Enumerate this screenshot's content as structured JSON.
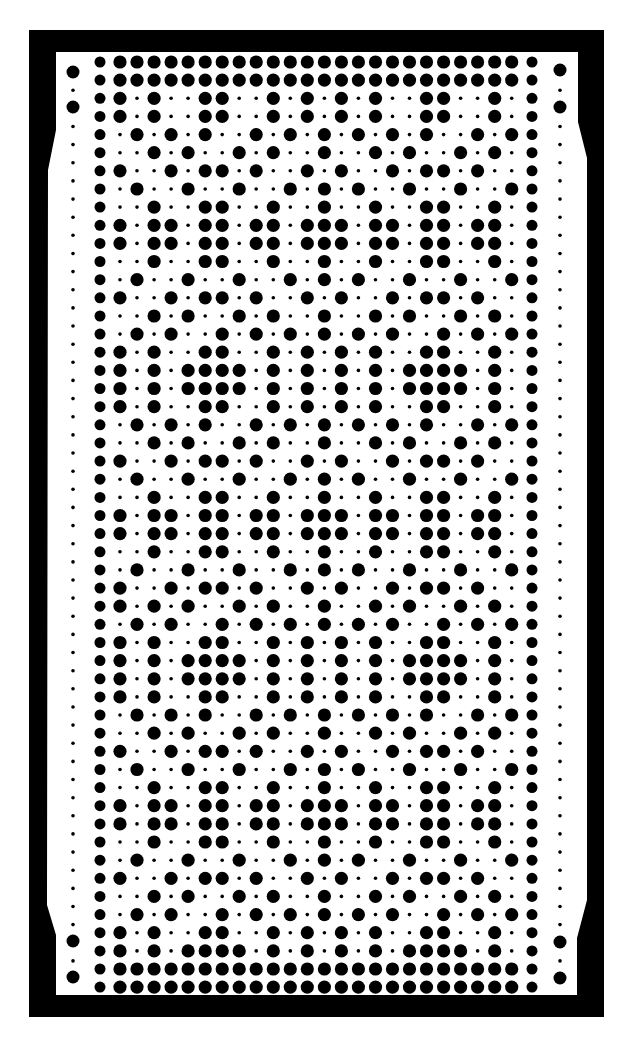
{
  "card": {
    "type": "knitting-machine-punch-card",
    "rows": 52,
    "pattern_columns": 24,
    "colors": {
      "hole": "#000000",
      "card": "#ffffff",
      "frame": "#000000"
    }
  },
  "row_legend": {
    "F": "111111111111111111111111",
    "A": "101001100101010100110010",
    "B": "010101001010101010100101",
    "Bp": "010100101010101010010101",
    "C": "001010010100100101001010",
    "Cs": "101010010100100101001010",
    "D": "100101101001010010110100",
    "E": "010010010010101001001001",
    "Fr": "001001100100100100110010",
    "G": "101101101101110110110110",
    "H": "101011110101010101111010"
  },
  "row_sequence": [
    "F",
    "F",
    "A",
    "A",
    "B",
    "C",
    "D",
    "E",
    "Fr",
    "G",
    "G",
    "Fr",
    "E",
    "D",
    "C",
    "Bp",
    "A",
    "H",
    "H",
    "A",
    "B",
    "C",
    "D",
    "E",
    "Fr",
    "G",
    "G",
    "Fr",
    "E",
    "D",
    "Cs",
    "Bp",
    "A",
    "H",
    "H",
    "A",
    "B",
    "C",
    "D",
    "E",
    "Fr",
    "G",
    "G",
    "Fr",
    "E",
    "D",
    "C",
    "Bp",
    "A",
    "H",
    "F",
    "F"
  ],
  "margin_big_holes": {
    "left": [
      72,
      107,
      941,
      977
    ],
    "right": [
      70,
      107,
      942,
      978
    ]
  }
}
